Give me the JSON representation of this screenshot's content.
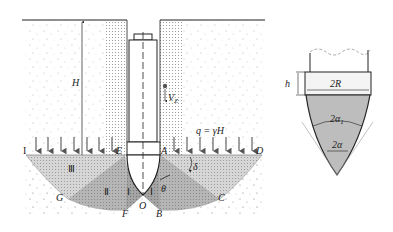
{
  "figure": {
    "main": {
      "depth_label": "H",
      "velocity_label": "V",
      "velocity_subscript": "Z",
      "surcharge_label": "q = γH",
      "points": {
        "I_left": "I",
        "E": "E",
        "A": "A",
        "D": "D",
        "G": "G",
        "F": "F",
        "O": "O",
        "B": "B",
        "C": "C"
      },
      "zones": {
        "zone_III": "Ⅲ",
        "zone_II": "Ⅱ",
        "zone_I_left": "Ⅰ",
        "zone_I_right": "Ⅰ"
      },
      "angles": {
        "delta": "δ",
        "theta": "θ"
      }
    },
    "detail": {
      "height_label": "h",
      "width_label": "2R",
      "outer_angle_label": "2α",
      "outer_angle_subscript": "1",
      "inner_angle_label": "2α"
    },
    "colors": {
      "soil_bg": "#ffffff",
      "soil_speckle": "#b0b0b0",
      "zone_light": "#d2d2d2",
      "zone_mid": "#b4b4b4",
      "zone_dark": "#a0a0a0",
      "line": "#222222",
      "arrow": "#555555"
    }
  }
}
